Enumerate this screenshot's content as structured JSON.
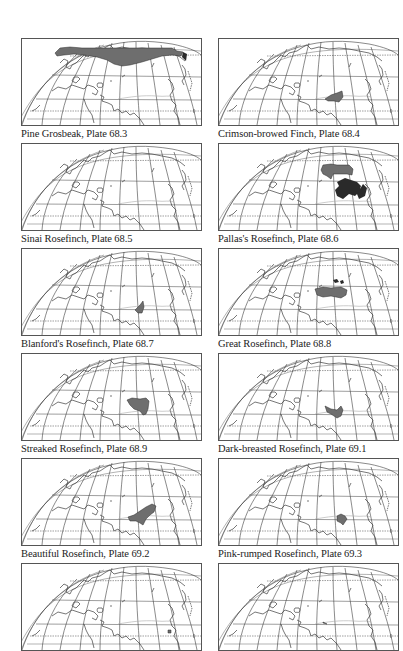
{
  "page": {
    "panels": [
      {
        "caption": "Pine Grosbeak, Plate 68.3",
        "range": "M33,14 L38,9 L48,8 L60,9 L150,9 L155,12 L161,13 L159,17 L150,16 L140,17 L130,20 L120,23 L108,26 L100,27 L92,25 L85,21 L75,18 L62,16 L52,15 L42,16 L35,17 Z",
        "range2": "M161,13 L165,15 L164,22 L160,18 Z"
      },
      {
        "caption": "Crimson-browed Finch, Plate 68.4",
        "range": "M106,60 L112,56 L118,54 L123,52 L124,58 L120,63 L115,62 L109,62 Z",
        "range2": ""
      },
      {
        "caption": "Sinai Rosefinch, Plate 68.5",
        "range": "",
        "range2": ""
      },
      {
        "caption": "Pallas's Rosefinch, Plate 68.6",
        "range": "M104,21 L112,20 L118,21 L130,21 L134,25 L133,31 L128,30 L120,30 L114,30 L112,35 L108,32 L104,30 L102,26 Z",
        "range2": "M118,38 L126,34 L132,36 L138,38 L142,42 L140,48 L136,52 L130,50 L124,55 L118,52 L116,46 L120,42 Z M144,40 L148,44 L146,52 L140,55 L138,50 Z"
      },
      {
        "caption": "Blanford's Rosefinch, Plate 68.7",
        "range": "M113,61 L118,56 L121,52 L122,58 L120,64 L116,64 Z",
        "range2": ""
      },
      {
        "caption": "Great Rosefinch, Plate 68.8",
        "range": "M96,40 L104,38 L112,39 L122,38 L128,41 L127,46 L122,49 L112,47 L104,48 L98,46 Z",
        "range2": "M114,31 L118,30 L120,33 L116,34 Z M121,32 L124,31 L125,34 L122,35 Z"
      },
      {
        "caption": "Streaked Rosefinch, Plate 68.9",
        "range": "M105,46 L110,44 L118,45 L124,44 L127,47 L126,55 L124,60 L121,61 L118,57 L112,55 L108,51 Z",
        "range2": ""
      },
      {
        "caption": "Dark-breasted Rosefinch, Plate 69.1",
        "range": "M106,52 L112,55 L118,56 L122,52 L124,56 L122,62 L118,64 L112,60 L108,58 Z",
        "range2": ""
      },
      {
        "caption": "Beautiful Rosefinch, Plate 69.2",
        "range": "M106,58 L112,56 L118,52 L124,48 L130,45 L134,47 L132,53 L128,56 L124,60 L121,66 L118,64 L114,62 L108,62 Z",
        "range2": ""
      },
      {
        "caption": "Pink-rumped Rosefinch, Plate 69.3",
        "range": "M118,57 L122,55 L126,57 L128,60 L126,63 L124,66 L122,64 L118,62 Z",
        "range2": ""
      },
      {
        "caption": "",
        "range": "M146,66 L149,66 L149,69 L146,69 Z",
        "range2": ""
      },
      {
        "caption": "",
        "range": "M104,58 L108,60 L104,59 Z",
        "range2": ""
      }
    ]
  },
  "colors": {
    "range_fill": "#6e6e6e",
    "range_dark": "#2a2a2a",
    "map_line": "#3c3c3c",
    "frame": "#555555",
    "caption": "#222222"
  }
}
